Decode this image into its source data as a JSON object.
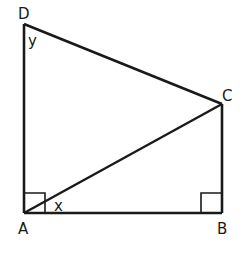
{
  "diagram": {
    "type": "geometry",
    "vertices": {
      "A": {
        "label": "A",
        "x": 24,
        "y": 213
      },
      "B": {
        "label": "B",
        "x": 222,
        "y": 213
      },
      "C": {
        "label": "C",
        "x": 222,
        "y": 104
      },
      "D": {
        "label": "D",
        "x": 24,
        "y": 24
      }
    },
    "segments": [
      "DA",
      "AB",
      "BC",
      "CD",
      "AC"
    ],
    "right_angles": [
      "A",
      "B"
    ],
    "angle_labels": {
      "x": {
        "label": "x",
        "at": "A",
        "between": [
          "AB",
          "AC"
        ]
      },
      "y": {
        "label": "y",
        "at": "D",
        "between": [
          "DA",
          "DC"
        ]
      }
    },
    "colors": {
      "stroke": "#1a1a1a",
      "background": "#ffffff"
    }
  }
}
